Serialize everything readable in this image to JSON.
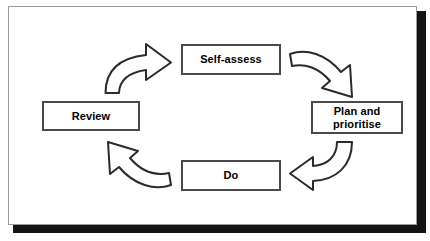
{
  "diagram": {
    "type": "cycle",
    "frame": {
      "border_color": "#9b9b9b",
      "shadow_color": "#141414",
      "background": "#ffffff"
    },
    "node_style": {
      "border_color": "#4a4a4a",
      "text_color": "#000000",
      "fill": "#ffffff"
    },
    "arrow_style": {
      "stroke_color": "#2b2b2b",
      "fill": "#ffffff"
    },
    "nodes": [
      {
        "id": "self-assess",
        "label": "Self-assess"
      },
      {
        "id": "plan-and-prioritise",
        "label": "Plan and\nprioritise",
        "line1": "Plan and",
        "line2": "prioritise"
      },
      {
        "id": "do",
        "label": "Do"
      },
      {
        "id": "review",
        "label": "Review"
      }
    ],
    "arrows": [
      {
        "id": "review-to-self-assess",
        "from": "review",
        "to": "self-assess",
        "direction": "right"
      },
      {
        "id": "self-assess-to-plan",
        "from": "self-assess",
        "to": "plan-and-prioritise",
        "direction": "down-right"
      },
      {
        "id": "plan-to-do",
        "from": "plan-and-prioritise",
        "to": "do",
        "direction": "left"
      },
      {
        "id": "do-to-review",
        "from": "do",
        "to": "review",
        "direction": "up-left"
      }
    ]
  }
}
